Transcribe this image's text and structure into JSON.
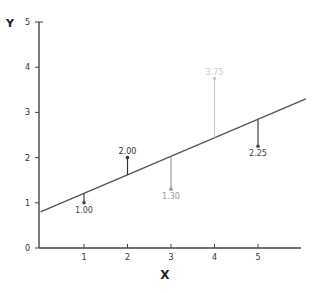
{
  "chart_data": {
    "type": "scatter",
    "title": "",
    "xlabel": "X",
    "ylabel": "Y",
    "xlim": [
      0,
      6.1
    ],
    "ylim": [
      0,
      5
    ],
    "x_ticks": [
      "1",
      "2",
      "3",
      "4",
      "5"
    ],
    "y_ticks": [
      "0",
      "1",
      "2",
      "3",
      "4",
      "5"
    ],
    "grid": false,
    "legend": null,
    "points": [
      {
        "x": 1,
        "y": 1.0,
        "label": "1.00",
        "color": "#444444"
      },
      {
        "x": 2,
        "y": 2.0,
        "label": "2.00",
        "color": "#333333"
      },
      {
        "x": 3,
        "y": 1.3,
        "label": "1.30",
        "color": "#999999"
      },
      {
        "x": 4,
        "y": 3.75,
        "label": "3.75",
        "color": "#c8c8c8"
      },
      {
        "x": 5,
        "y": 2.25,
        "label": "2.25",
        "color": "#444444"
      }
    ],
    "regression_line": {
      "intercept": 0.8,
      "slope": 0.41,
      "x_start": 0,
      "x_end": 6.1,
      "color": "#555555"
    },
    "residuals": "vertical segments from each point to the regression line"
  }
}
